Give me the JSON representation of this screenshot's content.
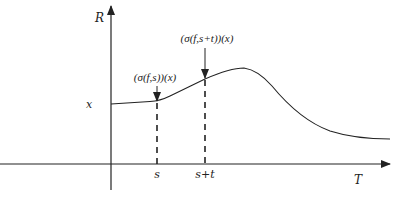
{
  "diagram": {
    "axes": {
      "y_label": "R",
      "x_label": "T",
      "origin_value_label": "x"
    },
    "ticks": {
      "s": "s",
      "s_plus_t": "s+t"
    },
    "annotations": {
      "at_s": "(σ(f,s))(x)",
      "at_s_plus_t": "(σ(f,s+t))(x)"
    },
    "colors": {
      "line": "#222222",
      "background": "#ffffff"
    }
  }
}
